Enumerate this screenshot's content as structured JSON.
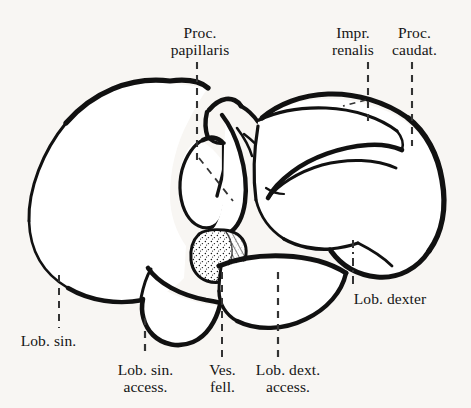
{
  "figure": {
    "domain": "anatomical-illustration",
    "background_color": "#f8f6f3",
    "ink_color": "#111111",
    "label_language": "Latin (abbreviated anatomical nomenclature)",
    "width": 471,
    "height": 408
  },
  "labels": [
    {
      "id": "proc-papillaris",
      "lines": [
        "Proc.",
        "papillaris"
      ],
      "text": "Proc. papillaris",
      "x": 200,
      "y": 24,
      "align": "center",
      "leader": {
        "type": "dashed-vertical-then-diagonal",
        "x": 197,
        "y_start": 62,
        "y_end": 160,
        "diagonal_to_x": 232,
        "diagonal_to_y": 200
      }
    },
    {
      "id": "impr-renalis",
      "lines": [
        "Impr.",
        "renalis"
      ],
      "text": "Impr. renalis",
      "x": 353,
      "y": 24,
      "align": "center",
      "leader": {
        "type": "dashed-vertical-with-branch",
        "x": 368,
        "y_start": 62,
        "y_end": 122,
        "diagonal_to_x": 345,
        "diagonal_to_y": 105
      }
    },
    {
      "id": "proc-caudat",
      "lines": [
        "Proc.",
        "caudat."
      ],
      "text": "Proc. caudat.",
      "x": 414,
      "y": 24,
      "align": "center",
      "leader": {
        "type": "dashed-vertical",
        "x": 412,
        "y_start": 62,
        "y_end": 146
      }
    },
    {
      "id": "lob-dexter",
      "lines": [
        "Lob. dexter"
      ],
      "text": "Lob. dexter",
      "x": 390,
      "y": 290,
      "align": "center",
      "leader": {
        "type": "dash-dot-vertical",
        "x": 353,
        "y_start": 240,
        "y_end": 285
      }
    },
    {
      "id": "lob-sin",
      "lines": [
        "Lob. sin."
      ],
      "text": "Lob. sin.",
      "x": 48,
      "y": 332,
      "align": "center",
      "leader": {
        "type": "dashed-vertical",
        "x": 59,
        "y_start": 275,
        "y_end": 328
      }
    },
    {
      "id": "lob-sin-access",
      "lines": [
        "Lob. sin.",
        "access."
      ],
      "text": "Lob. sin. access.",
      "x": 145,
      "y": 361,
      "align": "center",
      "leader": {
        "type": "dashed-vertical",
        "x": 145,
        "y_start": 318,
        "y_end": 357
      }
    },
    {
      "id": "ves-fell",
      "lines": [
        "Ves.",
        "fell."
      ],
      "text": "Ves. fell.",
      "x": 222,
      "y": 361,
      "align": "center",
      "leader": {
        "type": "dashed-vertical",
        "x": 222,
        "y_start": 272,
        "y_end": 357
      }
    },
    {
      "id": "lob-dext-access",
      "lines": [
        "Lob. dext.",
        "access."
      ],
      "text": "Lob. dext. access.",
      "x": 288,
      "y": 361,
      "align": "center",
      "leader": {
        "type": "dashed-vertical",
        "x": 278,
        "y_start": 272,
        "y_end": 357
      }
    }
  ]
}
